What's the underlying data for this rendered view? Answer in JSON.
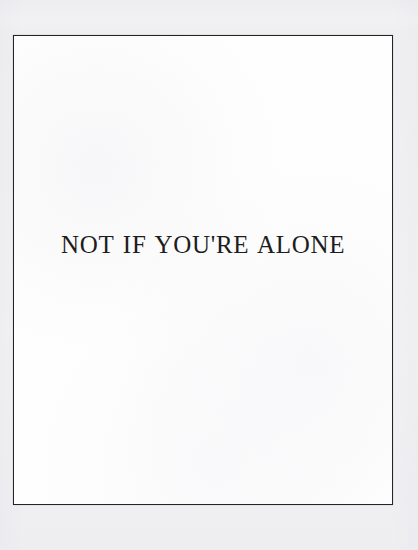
{
  "document": {
    "type": "scanned-book-plate",
    "caption_text": "NOT IF YOU'RE ALONE"
  },
  "plate": {
    "frame": {
      "border_color": "#232323",
      "interior_color": "#fefefe"
    }
  },
  "canvas": {
    "margin_color": "#f7f7f8"
  },
  "typography": {
    "caption_color": "#1d1d1d"
  }
}
